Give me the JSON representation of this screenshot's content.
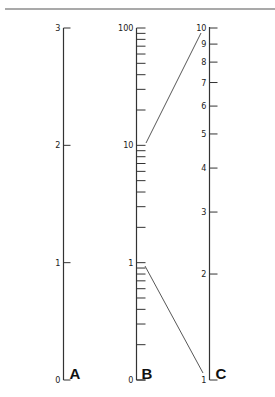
{
  "diagram": {
    "type": "nomogram",
    "axes": [
      {
        "name": "A",
        "scale": "linear",
        "ticks": [
          {
            "label": "0",
            "value": 0
          },
          {
            "label": "1",
            "value": 1
          },
          {
            "label": "2",
            "value": 2
          },
          {
            "label": "3",
            "value": 3
          }
        ]
      },
      {
        "name": "B",
        "scale": "log",
        "labeled_ticks": [
          {
            "label": "0",
            "value": 0
          },
          {
            "label": "1",
            "value": 1
          },
          {
            "label": "10",
            "value": 10
          },
          {
            "label": "100",
            "value": 100
          }
        ]
      },
      {
        "name": "C",
        "scale": "log",
        "ticks": [
          {
            "label": "1",
            "value": 1
          },
          {
            "label": "2",
            "value": 2
          },
          {
            "label": "3",
            "value": 3
          },
          {
            "label": "4",
            "value": 4
          },
          {
            "label": "5",
            "value": 5
          },
          {
            "label": "6",
            "value": 6
          },
          {
            "label": "7",
            "value": 7
          },
          {
            "label": "8",
            "value": 8
          },
          {
            "label": "9",
            "value": 9
          },
          {
            "label": "10",
            "value": 10
          }
        ]
      }
    ],
    "connectors": [
      {
        "from": "B=10",
        "to": "C=10"
      },
      {
        "from": "B=1",
        "to": "C=1"
      }
    ]
  }
}
